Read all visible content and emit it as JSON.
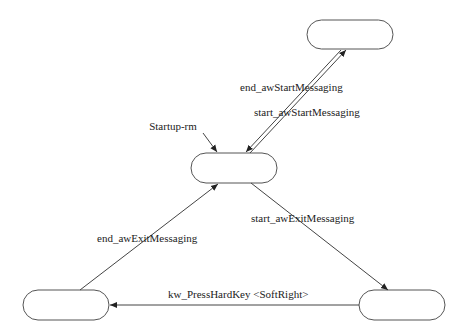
{
  "diagram": {
    "type": "state-machine",
    "nodes": [
      {
        "id": "top",
        "label": ""
      },
      {
        "id": "center",
        "label": ""
      },
      {
        "id": "bottom-left",
        "label": ""
      },
      {
        "id": "bottom-right",
        "label": ""
      }
    ],
    "initial_label": "Startup-rm",
    "edges": [
      {
        "from": "center",
        "to": "top",
        "label": "start_awStartMessaging"
      },
      {
        "from": "top",
        "to": "center",
        "label": "end_awStartMessaging"
      },
      {
        "from": "center",
        "to": "bottom-right",
        "label": "start_awExitMessaging"
      },
      {
        "from": "bottom-right",
        "to": "bottom-left",
        "label": "kw_PressHardKey <SoftRight>"
      },
      {
        "from": "bottom-left",
        "to": "center",
        "label": "end_awExitMessaging"
      }
    ]
  }
}
